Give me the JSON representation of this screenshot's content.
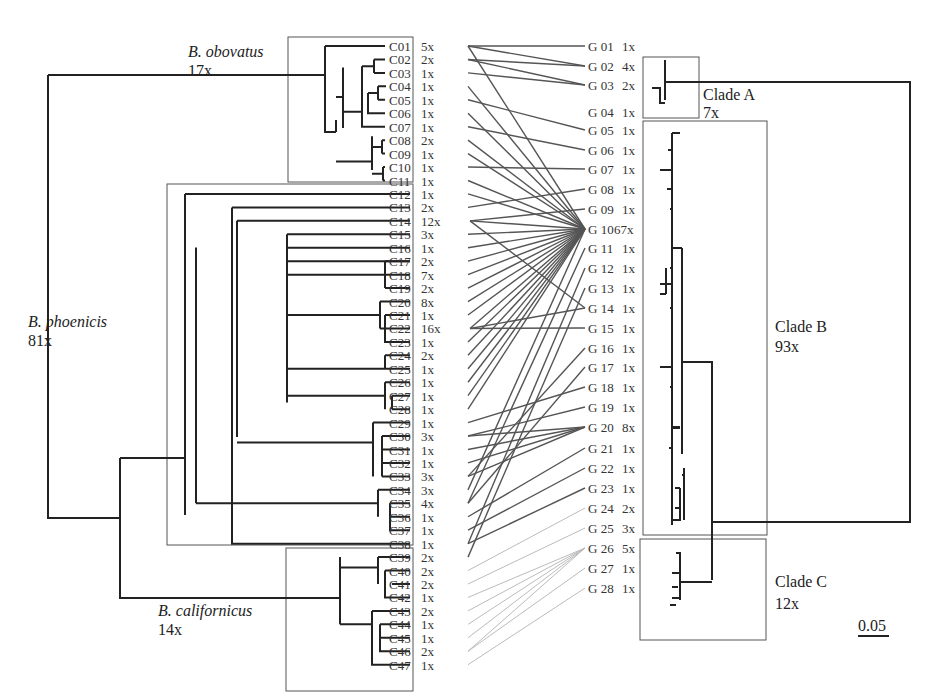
{
  "figure": {
    "title": "",
    "scale_bar": "0.05",
    "left_clades": [
      {
        "name": "B. obovatus",
        "count": "17x"
      },
      {
        "name": "B. phoenicis",
        "count": "81x"
      },
      {
        "name": "B. californicus",
        "count": "14x"
      }
    ],
    "right_clades": [
      {
        "name": "Clade A",
        "count": "7x"
      },
      {
        "name": "Clade B",
        "count": "93x"
      },
      {
        "name": "Clade C",
        "count": "12x"
      }
    ],
    "left_taxa": [
      {
        "id": "C01",
        "n": "5x"
      },
      {
        "id": "C02",
        "n": "2x"
      },
      {
        "id": "C03",
        "n": "1x"
      },
      {
        "id": "C04",
        "n": "1x"
      },
      {
        "id": "C05",
        "n": "1x"
      },
      {
        "id": "C06",
        "n": "1x"
      },
      {
        "id": "C07",
        "n": "1x"
      },
      {
        "id": "C08",
        "n": "2x"
      },
      {
        "id": "C09",
        "n": "1x"
      },
      {
        "id": "C10",
        "n": "1x"
      },
      {
        "id": "C11",
        "n": "1x"
      },
      {
        "id": "C12",
        "n": "1x"
      },
      {
        "id": "C13",
        "n": "2x"
      },
      {
        "id": "C14",
        "n": "12x"
      },
      {
        "id": "C15",
        "n": "3x"
      },
      {
        "id": "C16",
        "n": "1x"
      },
      {
        "id": "C17",
        "n": "2x"
      },
      {
        "id": "C18",
        "n": "7x"
      },
      {
        "id": "C19",
        "n": "2x"
      },
      {
        "id": "C20",
        "n": "8x"
      },
      {
        "id": "C21",
        "n": "1x"
      },
      {
        "id": "C22",
        "n": "16x"
      },
      {
        "id": "C23",
        "n": "1x"
      },
      {
        "id": "C24",
        "n": "2x"
      },
      {
        "id": "C25",
        "n": "1x"
      },
      {
        "id": "C26",
        "n": "1x"
      },
      {
        "id": "C27",
        "n": "1x"
      },
      {
        "id": "C28",
        "n": "1x"
      },
      {
        "id": "C29",
        "n": "1x"
      },
      {
        "id": "C30",
        "n": "3x"
      },
      {
        "id": "C31",
        "n": "1x"
      },
      {
        "id": "C32",
        "n": "1x"
      },
      {
        "id": "C33",
        "n": "3x"
      },
      {
        "id": "C34",
        "n": "3x"
      },
      {
        "id": "C35",
        "n": "4x"
      },
      {
        "id": "C36",
        "n": "1x"
      },
      {
        "id": "C37",
        "n": "1x"
      },
      {
        "id": "C38",
        "n": "1x"
      },
      {
        "id": "C39",
        "n": "2x"
      },
      {
        "id": "C40",
        "n": "2x"
      },
      {
        "id": "C41",
        "n": "2x"
      },
      {
        "id": "C42",
        "n": "1x"
      },
      {
        "id": "C43",
        "n": "2x"
      },
      {
        "id": "C44",
        "n": "1x"
      },
      {
        "id": "C45",
        "n": "1x"
      },
      {
        "id": "C46",
        "n": "2x"
      },
      {
        "id": "C47",
        "n": "1x"
      }
    ],
    "right_taxa": [
      {
        "id": "G 01",
        "n": "1x"
      },
      {
        "id": "G 02",
        "n": "4x"
      },
      {
        "id": "G 03",
        "n": "2x"
      },
      {
        "id": "G 04",
        "n": "1x"
      },
      {
        "id": "G 05",
        "n": "1x"
      },
      {
        "id": "G 06",
        "n": "1x"
      },
      {
        "id": "G 07",
        "n": "1x"
      },
      {
        "id": "G 08",
        "n": "1x"
      },
      {
        "id": "G 09",
        "n": "1x"
      },
      {
        "id": "G 10",
        "n": "67x"
      },
      {
        "id": "G 11",
        "n": "1x"
      },
      {
        "id": "G 12",
        "n": "1x"
      },
      {
        "id": "G 13",
        "n": "1x"
      },
      {
        "id": "G 14",
        "n": "1x"
      },
      {
        "id": "G 15",
        "n": "1x"
      },
      {
        "id": "G 16",
        "n": "1x"
      },
      {
        "id": "G 17",
        "n": "1x"
      },
      {
        "id": "G 18",
        "n": "1x"
      },
      {
        "id": "G 19",
        "n": "1x"
      },
      {
        "id": "G 20",
        "n": "8x"
      },
      {
        "id": "G 21",
        "n": "1x"
      },
      {
        "id": "G 22",
        "n": "1x"
      },
      {
        "id": "G 23",
        "n": "1x"
      },
      {
        "id": "G 24",
        "n": "2x"
      },
      {
        "id": "G 25",
        "n": "3x"
      },
      {
        "id": "G 26",
        "n": "5x"
      },
      {
        "id": "G 27",
        "n": "1x"
      },
      {
        "id": "G 28",
        "n": "1x"
      }
    ],
    "links": [
      [
        1,
        1
      ],
      [
        1,
        2
      ],
      [
        1,
        10
      ],
      [
        2,
        2
      ],
      [
        2,
        3
      ],
      [
        3,
        3
      ],
      [
        4,
        10
      ],
      [
        5,
        5
      ],
      [
        6,
        10
      ],
      [
        7,
        6
      ],
      [
        8,
        10
      ],
      [
        9,
        10
      ],
      [
        10,
        7
      ],
      [
        11,
        10
      ],
      [
        12,
        10
      ],
      [
        13,
        8
      ],
      [
        14,
        9
      ],
      [
        14,
        10
      ],
      [
        14,
        14
      ],
      [
        15,
        10
      ],
      [
        16,
        10
      ],
      [
        17,
        10
      ],
      [
        18,
        10
      ],
      [
        19,
        10
      ],
      [
        20,
        10
      ],
      [
        21,
        10
      ],
      [
        22,
        14
      ],
      [
        22,
        15
      ],
      [
        22,
        10
      ],
      [
        23,
        10
      ],
      [
        24,
        10
      ],
      [
        25,
        10
      ],
      [
        26,
        10
      ],
      [
        27,
        10
      ],
      [
        28,
        10
      ],
      [
        29,
        18
      ],
      [
        30,
        19
      ],
      [
        30,
        20
      ],
      [
        31,
        20
      ],
      [
        32,
        20
      ],
      [
        33,
        20
      ],
      [
        33,
        16
      ],
      [
        34,
        10
      ],
      [
        35,
        11
      ],
      [
        35,
        17
      ],
      [
        36,
        21
      ],
      [
        37,
        22
      ],
      [
        38,
        23
      ],
      [
        38,
        12
      ],
      [
        39,
        13
      ],
      [
        40,
        24
      ],
      [
        41,
        25
      ],
      [
        42,
        26
      ],
      [
        43,
        26
      ],
      [
        44,
        26
      ],
      [
        45,
        26
      ],
      [
        46,
        26
      ],
      [
        46,
        27
      ],
      [
        47,
        28
      ]
    ],
    "colors": {
      "tree": "#222222",
      "link": "#555555",
      "link_light": "#bbbbbb",
      "box": "#555555"
    }
  }
}
